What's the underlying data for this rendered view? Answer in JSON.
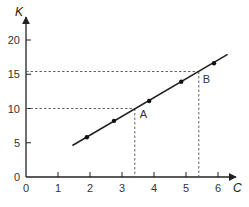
{
  "chart_data": {
    "type": "line",
    "title": "",
    "xlabel": "C",
    "ylabel": "K",
    "xlim": [
      0,
      6.5
    ],
    "ylim": [
      0,
      21
    ],
    "x_ticks": [
      0,
      1,
      2,
      3,
      4,
      5,
      6
    ],
    "y_ticks": [
      0,
      5,
      10,
      15,
      20
    ],
    "grid": false,
    "legend": null,
    "series": [
      {
        "name": "K vs C",
        "line_start": [
          1.45,
          4.6
        ],
        "line_end": [
          6.3,
          17.9
        ],
        "points": [
          {
            "x": 1.9,
            "y": 5.8
          },
          {
            "x": 2.75,
            "y": 8.2
          },
          {
            "x": 3.85,
            "y": 11.1
          },
          {
            "x": 4.85,
            "y": 13.9
          },
          {
            "x": 5.875,
            "y": 16.6
          }
        ]
      }
    ],
    "annotations": [
      {
        "label": "A",
        "x": 3.4,
        "y": 10
      },
      {
        "label": "B",
        "x": 5.4,
        "y": 15.4
      }
    ]
  },
  "axes": {
    "x_label": "C",
    "y_label": "K",
    "x_tick_labels": [
      "0",
      "1",
      "2",
      "3",
      "4",
      "5",
      "6"
    ],
    "y_tick_labels": [
      "0",
      "5",
      "10",
      "15",
      "20"
    ]
  },
  "annotations": {
    "a_label": "A",
    "b_label": "B"
  }
}
